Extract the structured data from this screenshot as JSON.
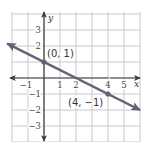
{
  "chart_data": {
    "type": "line",
    "title": "",
    "xlabel": "x",
    "ylabel": "y",
    "xlim": [
      -2,
      6
    ],
    "ylim": [
      -4,
      4
    ],
    "grid": true,
    "x_ticks": [
      "-1",
      "1",
      "2",
      "4",
      "5"
    ],
    "y_ticks": [
      "3",
      "2",
      "-1",
      "-2",
      "-3"
    ],
    "series": [
      {
        "name": "line",
        "equation": "y = -1/2 x + 1",
        "x": [
          -2.3,
          6
        ],
        "y": [
          2.15,
          -2
        ],
        "color": "#5d6572"
      }
    ],
    "points": [
      {
        "x": 0,
        "y": 1,
        "label": "(0, 1)"
      },
      {
        "x": 4,
        "y": -1,
        "label": "(4, −1)"
      }
    ]
  },
  "labels": {
    "x_axis": "x",
    "y_axis": "y",
    "x_ticks": [
      {
        "value": -1,
        "text": "−1"
      },
      {
        "value": 1,
        "text": "1"
      },
      {
        "value": 2,
        "text": "2"
      },
      {
        "value": 4,
        "text": "4"
      },
      {
        "value": 5,
        "text": "5"
      }
    ],
    "y_ticks": [
      {
        "value": 3,
        "text": "3"
      },
      {
        "value": 2,
        "text": "2"
      },
      {
        "value": -1,
        "text": "−1"
      },
      {
        "value": -2,
        "text": "−2"
      },
      {
        "value": -3,
        "text": "−3"
      }
    ],
    "point_a": "(0, 1)",
    "point_b": "(4, −1)"
  },
  "colors": {
    "grid": "#c8c8c8",
    "axis": "#3a3a3a",
    "line": "#5d6572"
  }
}
